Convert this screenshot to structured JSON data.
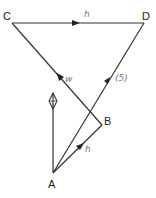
{
  "diagram": {
    "type": "vector-geometry",
    "vertices": [
      {
        "id": "A",
        "label": "A",
        "x": 53,
        "y": 173
      },
      {
        "id": "B",
        "label": "B",
        "x": 102,
        "y": 125
      },
      {
        "id": "C",
        "label": "C",
        "x": 12,
        "y": 23
      },
      {
        "id": "D",
        "label": "D",
        "x": 144,
        "y": 23
      }
    ],
    "edges": [
      {
        "from": "C",
        "to": "D",
        "arrow": "toward D",
        "annotation": "h"
      },
      {
        "from": "B",
        "to": "C",
        "arrow": "toward C",
        "annotation": "w"
      },
      {
        "from": "A",
        "to": "D",
        "arrow": "toward D",
        "annotation": "(5)"
      },
      {
        "from": "A",
        "to": "B",
        "arrow": "toward B",
        "annotation": "h"
      },
      {
        "from": "A",
        "to": "up",
        "arrow": "diamond marker",
        "annotation": ""
      }
    ],
    "labels": {
      "A": "A",
      "B": "B",
      "C": "C",
      "D": "D",
      "cd_note": "h",
      "cb_note": "w",
      "ad_note": "(5)",
      "ab_note": "h"
    }
  }
}
